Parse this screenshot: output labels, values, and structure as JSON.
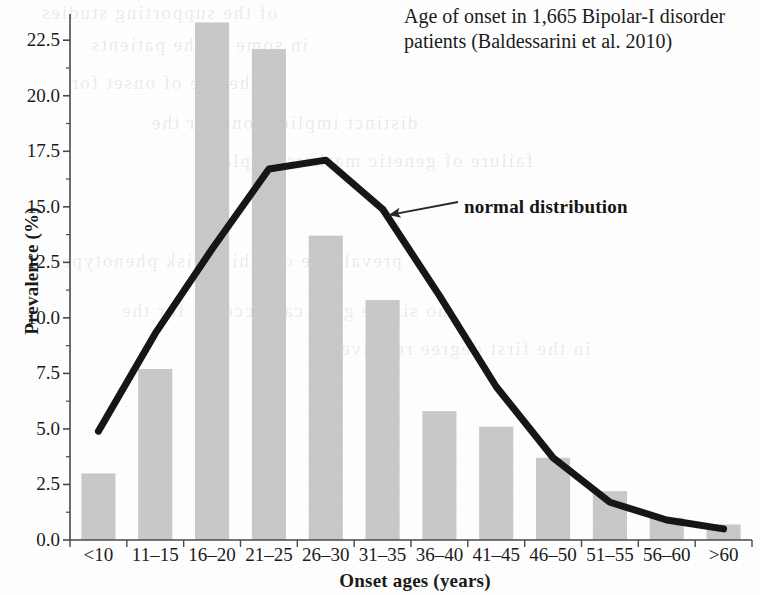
{
  "figure": {
    "title_line1": "Age of onset in 1,665 Bipolar-I disorder",
    "title_line2": "patients (Baldessarini et al. 2010)",
    "annotation": "normal distribution",
    "bar_color": "#c9c9c9",
    "line_color": "#161616",
    "axis_color": "#4a4a4a",
    "background": "#ffffff"
  },
  "ghost_text": {
    "lines": [
      "of the supporting  studies",
      "in some of the patients",
      "distinct implications for the",
      "failure of genetic markers  displays",
      "prevalence of a high risk  phenotype",
      "no single gene can  account  for  the",
      "the age of onset  for",
      "in the first  degree  relatives"
    ]
  },
  "chart_data": {
    "type": "bar",
    "title": "Age of onset in 1,665 Bipolar-I disorder patients (Baldessarini et al. 2010)",
    "xlabel": "Onset ages (years)",
    "ylabel": "Prevalence (%)",
    "ylim": [
      0,
      23.5
    ],
    "yticks": [
      "0.0",
      "2.5",
      "5.0",
      "7.5",
      "10.0",
      "12.5",
      "15.0",
      "17.5",
      "20.0",
      "22.5"
    ],
    "ytick_values": [
      0.0,
      2.5,
      5.0,
      7.5,
      10.0,
      12.5,
      15.0,
      17.5,
      20.0,
      22.5
    ],
    "grid": false,
    "legend": "none",
    "categories": [
      "<10",
      "11–15",
      "16–20",
      "21–25",
      "26–30",
      "31–35",
      "36–40",
      "41–45",
      "46–50",
      "51–55",
      "56–60",
      ">60"
    ],
    "series": [
      {
        "name": "Prevalence (%)",
        "kind": "bar",
        "values": [
          3.0,
          7.7,
          23.3,
          22.1,
          13.7,
          10.8,
          5.8,
          5.1,
          3.7,
          2.2,
          1.0,
          0.7
        ]
      },
      {
        "name": "normal distribution",
        "kind": "line",
        "values": [
          4.9,
          9.3,
          13.1,
          16.7,
          17.1,
          14.9,
          11.0,
          6.9,
          3.7,
          1.7,
          0.9,
          0.5
        ]
      }
    ],
    "annotations": [
      {
        "text": "normal distribution",
        "points_to_series": "normal distribution",
        "points_to_category": "31–35"
      }
    ]
  }
}
